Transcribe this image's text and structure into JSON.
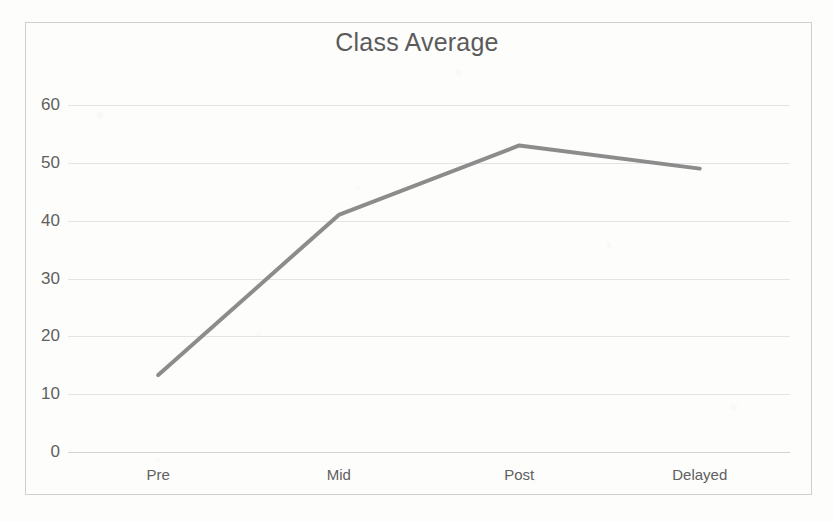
{
  "chart_data": {
    "type": "line",
    "title": "Class Average",
    "xlabel": "",
    "ylabel": "",
    "categories": [
      "Pre",
      "Mid",
      "Post",
      "Delayed"
    ],
    "values": [
      13.3,
      41,
      53,
      49
    ],
    "series": [
      {
        "name": "Class Average",
        "values": [
          13.3,
          41,
          53,
          49
        ]
      }
    ],
    "ylim": [
      0,
      60
    ],
    "yticks": [
      "0",
      "10",
      "20",
      "30",
      "40",
      "50",
      "60"
    ],
    "ytick_values": [
      0,
      10,
      20,
      30,
      40,
      50,
      60
    ],
    "grid": true,
    "legend": false,
    "legend_position": "none",
    "markers": false,
    "line_color": "#8c8c8c",
    "grid_color": "#e4e4e4",
    "axis_color": "#d2d2d2",
    "text_color": "#606060",
    "title_color": "#5b5b5b",
    "background_color": "#fdfdfc",
    "border_color": "#cfcfcf"
  }
}
